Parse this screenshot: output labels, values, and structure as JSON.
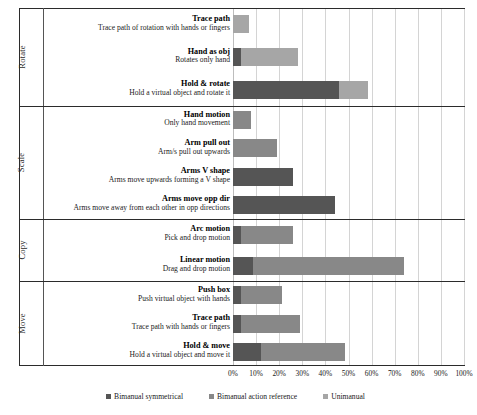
{
  "chart_data": {
    "type": "bar",
    "orientation": "horizontal",
    "stacked": true,
    "title": "",
    "xlabel": "",
    "ylabel": "",
    "xlim": [
      0,
      100
    ],
    "xticks": [
      "0%",
      "10%",
      "20%",
      "30%",
      "40%",
      "50%",
      "60%",
      "70%",
      "80%",
      "90%",
      "100%"
    ],
    "xtick_values": [
      0,
      10,
      20,
      30,
      40,
      50,
      60,
      70,
      80,
      90,
      100
    ],
    "grid": true,
    "legend_position": "bottom",
    "series": [
      {
        "name": "Bimanual symmetrical",
        "color": "#555555"
      },
      {
        "name": "Bimanual action reference",
        "color": "#888888"
      },
      {
        "name": "Unimanual",
        "color": "#a6a6a6"
      }
    ],
    "groups": [
      {
        "label": "Rotate",
        "rows": [
          {
            "title": "Trace path",
            "desc": "Trace path of rotation with hands or fingers",
            "values": [
              0,
              0,
              7.0
            ]
          },
          {
            "title": "Hand as  obj",
            "desc": "Rotates only hand",
            "values": [
              3.5,
              0,
              24.5
            ]
          },
          {
            "title": "Hold & rotate",
            "desc": "Hold a virtual object and rotate it",
            "values": [
              46.0,
              0,
              12.5
            ]
          }
        ]
      },
      {
        "label": "Scale",
        "rows": [
          {
            "title": "Hand motion",
            "desc": "Only hand movement",
            "values": [
              0,
              8.0,
              0
            ]
          },
          {
            "title": "Arm pull out",
            "desc": "Arm/s pull out upwards",
            "values": [
              0,
              19.0,
              0
            ]
          },
          {
            "title": "Arms V shape",
            "desc": "Arms move upwards forming a V shape",
            "values": [
              26.0,
              0,
              0
            ]
          },
          {
            "title": "Arms move opp dir",
            "desc": "Arms move away from each other in opp directions",
            "values": [
              44.0,
              0,
              0
            ]
          }
        ]
      },
      {
        "label": "Copy",
        "rows": [
          {
            "title": "Arc motion",
            "desc": "Pick and drop motion",
            "values": [
              3.5,
              22.5,
              0
            ]
          },
          {
            "title": "Linear motion",
            "desc": "Drag and drop motion",
            "values": [
              8.5,
              65.5,
              0
            ]
          }
        ]
      },
      {
        "label": "Move",
        "rows": [
          {
            "title": "Push box",
            "desc": "Push virtual object with hands",
            "values": [
              3.5,
              17.5,
              0
            ]
          },
          {
            "title": "Trace path",
            "desc": "Trace path with hands or fingers",
            "values": [
              3.5,
              25.5,
              0
            ]
          },
          {
            "title": "Hold & move",
            "desc": "Hold a virtual object and move it",
            "values": [
              12.0,
              36.5,
              0
            ]
          }
        ]
      }
    ]
  }
}
